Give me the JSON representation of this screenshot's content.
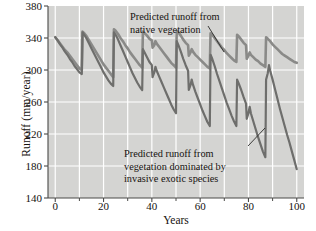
{
  "chart_data": {
    "type": "line",
    "title": "",
    "xlabel": "Years",
    "ylabel": "Runoff (mm/year)",
    "xlim": [
      -3,
      103
    ],
    "ylim": [
      140,
      380
    ],
    "xticks": [
      0,
      20,
      40,
      60,
      80,
      100
    ],
    "xticks_minor": [
      10,
      30,
      50,
      70,
      90
    ],
    "yticks": [
      140,
      180,
      220,
      260,
      300,
      340,
      380
    ],
    "grid": true,
    "grid_color": "#ffffff",
    "plot_background": "#d4d4d2",
    "legend": "none",
    "annotations": [
      {
        "name": "native-vegetation-label",
        "lines": [
          "Predicted runoff from",
          "native vegetation"
        ],
        "points_to_series": "Predicted runoff from native vegetation"
      },
      {
        "name": "invasive-species-label",
        "lines": [
          "Predicted runoff from",
          "vegetation dominated by",
          "invasive exotic species"
        ],
        "points_to_series": "Predicted runoff from vegetation dominated by invasive exotic species"
      }
    ],
    "series": [
      {
        "name": "Predicted runoff from native vegetation",
        "color": "#8a8a88",
        "width": 2.6,
        "points": [
          [
            0,
            341
          ],
          [
            1,
            337
          ],
          [
            2,
            333
          ],
          [
            3,
            329
          ],
          [
            4,
            325
          ],
          [
            5,
            322
          ],
          [
            6,
            318
          ],
          [
            7,
            314
          ],
          [
            8,
            310
          ],
          [
            9,
            306
          ],
          [
            10,
            302
          ],
          [
            11,
            300
          ],
          [
            11.3,
            348
          ],
          [
            12,
            346
          ],
          [
            13,
            342
          ],
          [
            14,
            337
          ],
          [
            15,
            332
          ],
          [
            16,
            327
          ],
          [
            17,
            322
          ],
          [
            18,
            317
          ],
          [
            19,
            312
          ],
          [
            20,
            307
          ],
          [
            21,
            303
          ],
          [
            22,
            299
          ],
          [
            23,
            295
          ],
          [
            24,
            291
          ],
          [
            24.3,
            351
          ],
          [
            25,
            349
          ],
          [
            26,
            345
          ],
          [
            27,
            340
          ],
          [
            28,
            336
          ],
          [
            29,
            331
          ],
          [
            30,
            327
          ],
          [
            31,
            322
          ],
          [
            32,
            318
          ],
          [
            33,
            314
          ],
          [
            34,
            310
          ],
          [
            35,
            306
          ],
          [
            36,
            303
          ],
          [
            36.3,
            348
          ],
          [
            37,
            346
          ],
          [
            38,
            343
          ],
          [
            39,
            339
          ],
          [
            40,
            337
          ],
          [
            40.3,
            328
          ],
          [
            41,
            331
          ],
          [
            41.5,
            336
          ],
          [
            42,
            333
          ],
          [
            43,
            329
          ],
          [
            44,
            325
          ],
          [
            45,
            321
          ],
          [
            46,
            317
          ],
          [
            47,
            313
          ],
          [
            48,
            309
          ],
          [
            49,
            306
          ],
          [
            50,
            303
          ],
          [
            50.3,
            349
          ],
          [
            51,
            347
          ],
          [
            52,
            343
          ],
          [
            53,
            338
          ],
          [
            54,
            334
          ],
          [
            55,
            331
          ],
          [
            55.3,
            318
          ],
          [
            56,
            322
          ],
          [
            56.5,
            326
          ],
          [
            57,
            323
          ],
          [
            58,
            319
          ],
          [
            59,
            316
          ],
          [
            60,
            313
          ],
          [
            61,
            310
          ],
          [
            62,
            307
          ],
          [
            63,
            304
          ],
          [
            64,
            302
          ],
          [
            64.3,
            346
          ],
          [
            65,
            344
          ],
          [
            66,
            340
          ],
          [
            67,
            336
          ],
          [
            68,
            332
          ],
          [
            69,
            328
          ],
          [
            70,
            325
          ],
          [
            71,
            321
          ],
          [
            72,
            318
          ],
          [
            73,
            315
          ],
          [
            74,
            312
          ],
          [
            75,
            310
          ],
          [
            75.3,
            344
          ],
          [
            76,
            342
          ],
          [
            77,
            338
          ],
          [
            78,
            334
          ],
          [
            79,
            331
          ],
          [
            79.3,
            314
          ],
          [
            80,
            318
          ],
          [
            80.5,
            322
          ],
          [
            81,
            319
          ],
          [
            82,
            316
          ],
          [
            83,
            313
          ],
          [
            84,
            311
          ],
          [
            85,
            308
          ],
          [
            86,
            306
          ],
          [
            87,
            304
          ],
          [
            87.3,
            341
          ],
          [
            88,
            339
          ],
          [
            89,
            336
          ],
          [
            90,
            332
          ],
          [
            91,
            329
          ],
          [
            92,
            326
          ],
          [
            93,
            323
          ],
          [
            94,
            320
          ],
          [
            95,
            318
          ],
          [
            96,
            316
          ],
          [
            97,
            314
          ],
          [
            98,
            312
          ],
          [
            99,
            310
          ],
          [
            100,
            309
          ]
        ]
      },
      {
        "name": "Predicted runoff from vegetation dominated by invasive exotic species",
        "color": "#6e6e6c",
        "width": 2.2,
        "points": [
          [
            0,
            341
          ],
          [
            1,
            337
          ],
          [
            2,
            332
          ],
          [
            3,
            328
          ],
          [
            4,
            323
          ],
          [
            5,
            319
          ],
          [
            6,
            314
          ],
          [
            7,
            310
          ],
          [
            8,
            305
          ],
          [
            9,
            301
          ],
          [
            10,
            297
          ],
          [
            11,
            295
          ],
          [
            11.3,
            347
          ],
          [
            12,
            344
          ],
          [
            13,
            339
          ],
          [
            14,
            333
          ],
          [
            15,
            327
          ],
          [
            16,
            321
          ],
          [
            17,
            315
          ],
          [
            18,
            309
          ],
          [
            19,
            303
          ],
          [
            20,
            297
          ],
          [
            21,
            292
          ],
          [
            22,
            287
          ],
          [
            23,
            283
          ],
          [
            24,
            280
          ],
          [
            24.3,
            347
          ],
          [
            25,
            344
          ],
          [
            26,
            338
          ],
          [
            27,
            331
          ],
          [
            28,
            324
          ],
          [
            29,
            317
          ],
          [
            30,
            310
          ],
          [
            31,
            303
          ],
          [
            32,
            296
          ],
          [
            33,
            290
          ],
          [
            34,
            284
          ],
          [
            35,
            279
          ],
          [
            36,
            275
          ],
          [
            36.3,
            326
          ],
          [
            37,
            322
          ],
          [
            38,
            316
          ],
          [
            39,
            310
          ],
          [
            40,
            306
          ],
          [
            40.3,
            291
          ],
          [
            41,
            297
          ],
          [
            41.5,
            304
          ],
          [
            42,
            299
          ],
          [
            43,
            292
          ],
          [
            44,
            285
          ],
          [
            45,
            278
          ],
          [
            46,
            271
          ],
          [
            47,
            264
          ],
          [
            48,
            257
          ],
          [
            49,
            251
          ],
          [
            50,
            246
          ],
          [
            50.3,
            336
          ],
          [
            51,
            331
          ],
          [
            52,
            323
          ],
          [
            53,
            314
          ],
          [
            54,
            306
          ],
          [
            55,
            299
          ],
          [
            55.3,
            275
          ],
          [
            56,
            281
          ],
          [
            56.5,
            288
          ],
          [
            57,
            282
          ],
          [
            58,
            273
          ],
          [
            59,
            265
          ],
          [
            60,
            257
          ],
          [
            61,
            249
          ],
          [
            62,
            242
          ],
          [
            63,
            235
          ],
          [
            64,
            230
          ],
          [
            64.3,
            319
          ],
          [
            65,
            314
          ],
          [
            66,
            305
          ],
          [
            67,
            295
          ],
          [
            68,
            286
          ],
          [
            69,
            277
          ],
          [
            70,
            268
          ],
          [
            71,
            259
          ],
          [
            72,
            251
          ],
          [
            73,
            243
          ],
          [
            74,
            236
          ],
          [
            75,
            230
          ],
          [
            75.3,
            288
          ],
          [
            76,
            283
          ],
          [
            77,
            275
          ],
          [
            78,
            266
          ],
          [
            79,
            258
          ],
          [
            79.3,
            239
          ],
          [
            80,
            246
          ],
          [
            80.5,
            254
          ],
          [
            81,
            246
          ],
          [
            82,
            236
          ],
          [
            83,
            226
          ],
          [
            84,
            216
          ],
          [
            85,
            207
          ],
          [
            86,
            198
          ],
          [
            87,
            191
          ],
          [
            87.3,
            288
          ],
          [
            88,
            296
          ],
          [
            88.5,
            306
          ],
          [
            89,
            299
          ],
          [
            90,
            288
          ],
          [
            91,
            276
          ],
          [
            92,
            264
          ],
          [
            93,
            252
          ],
          [
            94,
            241
          ],
          [
            95,
            230
          ],
          [
            96,
            219
          ],
          [
            97,
            209
          ],
          [
            98,
            198
          ],
          [
            99,
            187
          ],
          [
            100,
            176
          ]
        ]
      }
    ]
  }
}
